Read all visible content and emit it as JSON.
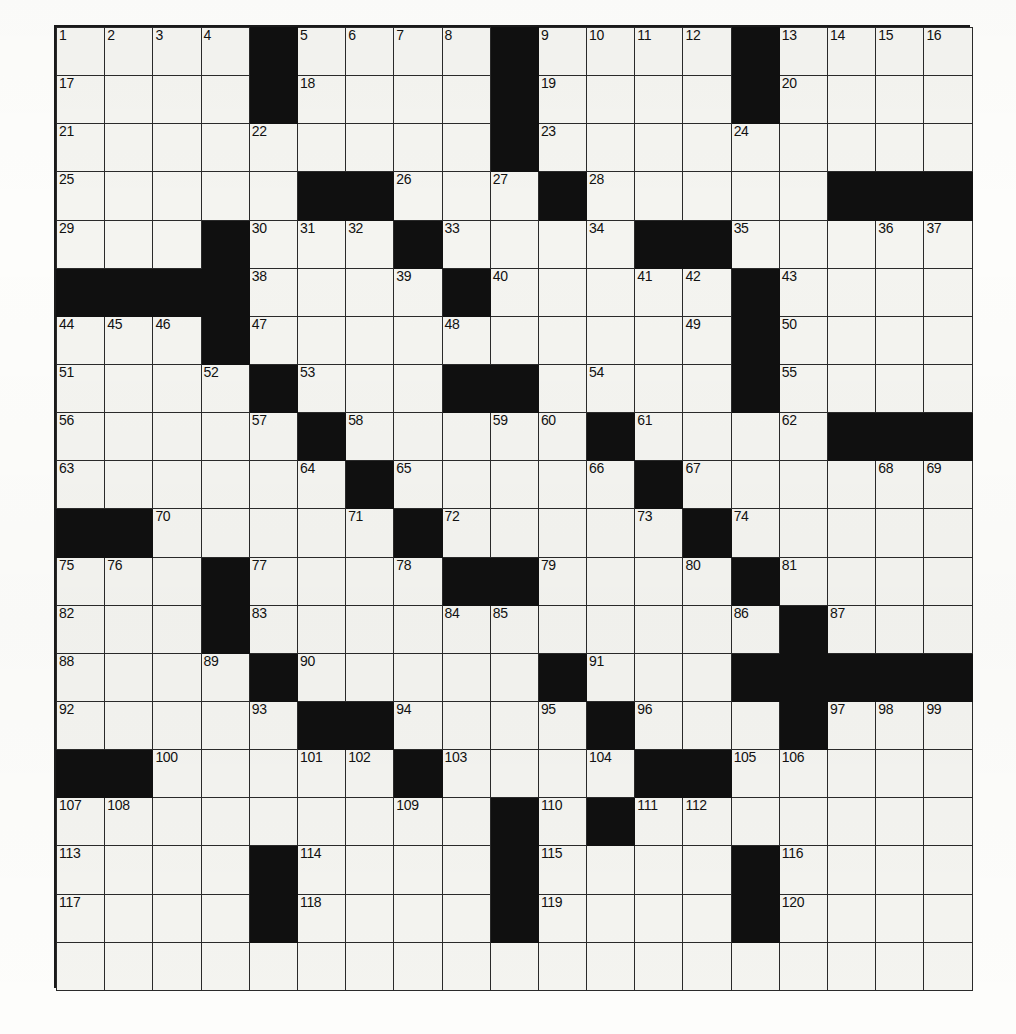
{
  "puzzle": {
    "kind": "crossword-grid",
    "rows": 20,
    "cols": 19,
    "colors": {
      "paper": "#fdfdfb",
      "cell_fill": "#f4f4f0",
      "block_fill": "#101010",
      "grid_line": "#2a2a2a",
      "border": "#1a1a1a",
      "number_text": "#111111"
    },
    "highest_number": 120,
    "numbers": [
      {
        "n": "1",
        "r": 1,
        "c": 1
      },
      {
        "n": "2",
        "r": 1,
        "c": 2
      },
      {
        "n": "3",
        "r": 1,
        "c": 3
      },
      {
        "n": "4",
        "r": 1,
        "c": 4
      },
      {
        "n": "5",
        "r": 1,
        "c": 6
      },
      {
        "n": "6",
        "r": 1,
        "c": 7
      },
      {
        "n": "7",
        "r": 1,
        "c": 8
      },
      {
        "n": "8",
        "r": 1,
        "c": 9
      },
      {
        "n": "9",
        "r": 1,
        "c": 11
      },
      {
        "n": "10",
        "r": 1,
        "c": 12
      },
      {
        "n": "11",
        "r": 1,
        "c": 13
      },
      {
        "n": "12",
        "r": 1,
        "c": 14
      },
      {
        "n": "13",
        "r": 1,
        "c": 16
      },
      {
        "n": "14",
        "r": 1,
        "c": 17
      },
      {
        "n": "15",
        "r": 1,
        "c": 18
      },
      {
        "n": "16",
        "r": 1,
        "c": 19
      },
      {
        "n": "17",
        "r": 2,
        "c": 1
      },
      {
        "n": "18",
        "r": 2,
        "c": 6
      },
      {
        "n": "19",
        "r": 2,
        "c": 11
      },
      {
        "n": "20",
        "r": 2,
        "c": 16
      },
      {
        "n": "21",
        "r": 3,
        "c": 1
      },
      {
        "n": "22",
        "r": 3,
        "c": 5
      },
      {
        "n": "23",
        "r": 3,
        "c": 11
      },
      {
        "n": "24",
        "r": 3,
        "c": 15
      },
      {
        "n": "25",
        "r": 4,
        "c": 1
      },
      {
        "n": "26",
        "r": 4,
        "c": 8
      },
      {
        "n": "27",
        "r": 4,
        "c": 10
      },
      {
        "n": "28",
        "r": 4,
        "c": 12
      },
      {
        "n": "29",
        "r": 5,
        "c": 1
      },
      {
        "n": "30",
        "r": 5,
        "c": 5
      },
      {
        "n": "31",
        "r": 5,
        "c": 6
      },
      {
        "n": "32",
        "r": 5,
        "c": 7
      },
      {
        "n": "33",
        "r": 5,
        "c": 9
      },
      {
        "n": "34",
        "r": 5,
        "c": 12
      },
      {
        "n": "35",
        "r": 5,
        "c": 15
      },
      {
        "n": "36",
        "r": 5,
        "c": 18
      },
      {
        "n": "37",
        "r": 5,
        "c": 19
      },
      {
        "n": "38",
        "r": 6,
        "c": 5
      },
      {
        "n": "39",
        "r": 6,
        "c": 8
      },
      {
        "n": "40",
        "r": 6,
        "c": 10
      },
      {
        "n": "41",
        "r": 6,
        "c": 13
      },
      {
        "n": "42",
        "r": 6,
        "c": 14
      },
      {
        "n": "43",
        "r": 6,
        "c": 16
      },
      {
        "n": "44",
        "r": 7,
        "c": 1
      },
      {
        "n": "45",
        "r": 7,
        "c": 2
      },
      {
        "n": "46",
        "r": 7,
        "c": 3
      },
      {
        "n": "47",
        "r": 7,
        "c": 5
      },
      {
        "n": "48",
        "r": 7,
        "c": 9
      },
      {
        "n": "49",
        "r": 7,
        "c": 14
      },
      {
        "n": "50",
        "r": 7,
        "c": 16
      },
      {
        "n": "51",
        "r": 8,
        "c": 1
      },
      {
        "n": "52",
        "r": 8,
        "c": 4
      },
      {
        "n": "53",
        "r": 8,
        "c": 6
      },
      {
        "n": "54",
        "r": 8,
        "c": 12
      },
      {
        "n": "55",
        "r": 8,
        "c": 16
      },
      {
        "n": "56",
        "r": 9,
        "c": 1
      },
      {
        "n": "57",
        "r": 9,
        "c": 5
      },
      {
        "n": "58",
        "r": 9,
        "c": 7
      },
      {
        "n": "59",
        "r": 9,
        "c": 10
      },
      {
        "n": "60",
        "r": 9,
        "c": 11
      },
      {
        "n": "61",
        "r": 9,
        "c": 13
      },
      {
        "n": "62",
        "r": 9,
        "c": 16
      },
      {
        "n": "63",
        "r": 10,
        "c": 1
      },
      {
        "n": "64",
        "r": 10,
        "c": 6
      },
      {
        "n": "65",
        "r": 10,
        "c": 8
      },
      {
        "n": "66",
        "r": 10,
        "c": 12
      },
      {
        "n": "67",
        "r": 10,
        "c": 14
      },
      {
        "n": "68",
        "r": 10,
        "c": 18
      },
      {
        "n": "69",
        "r": 10,
        "c": 19
      },
      {
        "n": "70",
        "r": 11,
        "c": 3
      },
      {
        "n": "71",
        "r": 11,
        "c": 7
      },
      {
        "n": "72",
        "r": 11,
        "c": 9
      },
      {
        "n": "73",
        "r": 11,
        "c": 13
      },
      {
        "n": "74",
        "r": 11,
        "c": 15
      },
      {
        "n": "75",
        "r": 12,
        "c": 1
      },
      {
        "n": "76",
        "r": 12,
        "c": 2
      },
      {
        "n": "77",
        "r": 12,
        "c": 5
      },
      {
        "n": "78",
        "r": 12,
        "c": 8
      },
      {
        "n": "79",
        "r": 12,
        "c": 11
      },
      {
        "n": "80",
        "r": 12,
        "c": 14
      },
      {
        "n": "81",
        "r": 12,
        "c": 16
      },
      {
        "n": "82",
        "r": 13,
        "c": 1
      },
      {
        "n": "83",
        "r": 13,
        "c": 5
      },
      {
        "n": "84",
        "r": 13,
        "c": 9
      },
      {
        "n": "85",
        "r": 13,
        "c": 10
      },
      {
        "n": "86",
        "r": 13,
        "c": 15
      },
      {
        "n": "87",
        "r": 13,
        "c": 17
      },
      {
        "n": "88",
        "r": 14,
        "c": 1
      },
      {
        "n": "89",
        "r": 14,
        "c": 4
      },
      {
        "n": "90",
        "r": 14,
        "c": 6
      },
      {
        "n": "91",
        "r": 14,
        "c": 12
      },
      {
        "n": "92",
        "r": 15,
        "c": 1
      },
      {
        "n": "93",
        "r": 15,
        "c": 5
      },
      {
        "n": "94",
        "r": 15,
        "c": 8
      },
      {
        "n": "95",
        "r": 15,
        "c": 11
      },
      {
        "n": "96",
        "r": 15,
        "c": 13
      },
      {
        "n": "97",
        "r": 15,
        "c": 17
      },
      {
        "n": "98",
        "r": 15,
        "c": 18
      },
      {
        "n": "99",
        "r": 15,
        "c": 19
      },
      {
        "n": "100",
        "r": 16,
        "c": 3
      },
      {
        "n": "101",
        "r": 16,
        "c": 6
      },
      {
        "n": "102",
        "r": 16,
        "c": 7
      },
      {
        "n": "103",
        "r": 16,
        "c": 9
      },
      {
        "n": "104",
        "r": 16,
        "c": 12
      },
      {
        "n": "105",
        "r": 16,
        "c": 15
      },
      {
        "n": "106",
        "r": 16,
        "c": 16
      },
      {
        "n": "107",
        "r": 17,
        "c": 1
      },
      {
        "n": "108",
        "r": 17,
        "c": 2
      },
      {
        "n": "109",
        "r": 17,
        "c": 8
      },
      {
        "n": "110",
        "r": 17,
        "c": 11
      },
      {
        "n": "111",
        "r": 17,
        "c": 13
      },
      {
        "n": "112",
        "r": 17,
        "c": 14
      },
      {
        "n": "113",
        "r": 18,
        "c": 1
      },
      {
        "n": "114",
        "r": 18,
        "c": 6
      },
      {
        "n": "115",
        "r": 18,
        "c": 11
      },
      {
        "n": "116",
        "r": 18,
        "c": 16
      },
      {
        "n": "117",
        "r": 19,
        "c": 1
      },
      {
        "n": "118",
        "r": 19,
        "c": 6
      },
      {
        "n": "119",
        "r": 19,
        "c": 11
      },
      {
        "n": "120",
        "r": 19,
        "c": 16
      }
    ],
    "blocks": [
      {
        "r": 1,
        "c": 5
      },
      {
        "r": 1,
        "c": 10
      },
      {
        "r": 1,
        "c": 15
      },
      {
        "r": 2,
        "c": 5
      },
      {
        "r": 2,
        "c": 10
      },
      {
        "r": 2,
        "c": 15
      },
      {
        "r": 3,
        "c": 10
      },
      {
        "r": 4,
        "c": 6
      },
      {
        "r": 4,
        "c": 7
      },
      {
        "r": 4,
        "c": 11
      },
      {
        "r": 4,
        "c": 17
      },
      {
        "r": 4,
        "c": 18
      },
      {
        "r": 4,
        "c": 19
      },
      {
        "r": 5,
        "c": 4
      },
      {
        "r": 5,
        "c": 8
      },
      {
        "r": 5,
        "c": 13
      },
      {
        "r": 5,
        "c": 14
      },
      {
        "r": 6,
        "c": 1
      },
      {
        "r": 6,
        "c": 2
      },
      {
        "r": 6,
        "c": 3
      },
      {
        "r": 6,
        "c": 4
      },
      {
        "r": 6,
        "c": 9
      },
      {
        "r": 6,
        "c": 15
      },
      {
        "r": 7,
        "c": 4
      },
      {
        "r": 7,
        "c": 15
      },
      {
        "r": 8,
        "c": 5
      },
      {
        "r": 8,
        "c": 9
      },
      {
        "r": 8,
        "c": 10
      },
      {
        "r": 8,
        "c": 15
      },
      {
        "r": 9,
        "c": 6
      },
      {
        "r": 9,
        "c": 12
      },
      {
        "r": 9,
        "c": 17
      },
      {
        "r": 9,
        "c": 18
      },
      {
        "r": 9,
        "c": 19
      },
      {
        "r": 10,
        "c": 7
      },
      {
        "r": 10,
        "c": 13
      },
      {
        "r": 11,
        "c": 1
      },
      {
        "r": 11,
        "c": 2
      },
      {
        "r": 11,
        "c": 8
      },
      {
        "r": 11,
        "c": 14
      },
      {
        "r": 12,
        "c": 4
      },
      {
        "r": 12,
        "c": 9
      },
      {
        "r": 12,
        "c": 10
      },
      {
        "r": 12,
        "c": 15
      },
      {
        "r": 13,
        "c": 4
      },
      {
        "r": 13,
        "c": 16
      },
      {
        "r": 14,
        "c": 5
      },
      {
        "r": 14,
        "c": 11
      },
      {
        "r": 14,
        "c": 15
      },
      {
        "r": 14,
        "c": 16
      },
      {
        "r": 14,
        "c": 17
      },
      {
        "r": 14,
        "c": 18
      },
      {
        "r": 14,
        "c": 19
      },
      {
        "r": 15,
        "c": 6
      },
      {
        "r": 15,
        "c": 7
      },
      {
        "r": 15,
        "c": 12
      },
      {
        "r": 15,
        "c": 16
      },
      {
        "r": 16,
        "c": 1
      },
      {
        "r": 16,
        "c": 2
      },
      {
        "r": 16,
        "c": 8
      },
      {
        "r": 16,
        "c": 13
      },
      {
        "r": 16,
        "c": 14
      },
      {
        "r": 17,
        "c": 10
      },
      {
        "r": 17,
        "c": 12
      },
      {
        "r": 18,
        "c": 5
      },
      {
        "r": 18,
        "c": 10
      },
      {
        "r": 18,
        "c": 15
      },
      {
        "r": 19,
        "c": 5
      },
      {
        "r": 19,
        "c": 10
      },
      {
        "r": 19,
        "c": 15
      }
    ]
  }
}
